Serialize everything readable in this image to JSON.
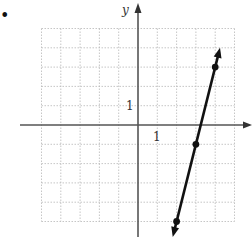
{
  "problem": {
    "bullet": "•"
  },
  "chart_data": {
    "type": "line",
    "title": "",
    "xlabel": "",
    "ylabel": "y",
    "xlim": [
      -5,
      5
    ],
    "ylim": [
      -5,
      5
    ],
    "grid": true,
    "grid_style": "dotted",
    "tick_labels": {
      "x": [
        "1"
      ],
      "y": [
        "1"
      ]
    },
    "series": [
      {
        "name": "line",
        "equation": "y = 4x - 13",
        "slope": 4,
        "intercept": -13,
        "points": [
          {
            "x": 2,
            "y": -5
          },
          {
            "x": 3,
            "y": -1
          },
          {
            "x": 4,
            "y": 3
          }
        ],
        "arrows": "both",
        "color": "#111111"
      }
    ]
  },
  "labels": {
    "y_axis": "y",
    "x_tick": "1",
    "y_tick": "1"
  },
  "colors": {
    "grid": "#b8b8b8",
    "axis": "#555555",
    "line": "#111111"
  }
}
